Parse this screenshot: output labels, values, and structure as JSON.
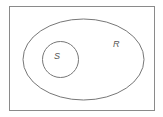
{
  "diagram": {
    "type": "venn",
    "universe": {
      "x": 9.5,
      "y": 6.5,
      "width": 145,
      "height": 104,
      "stroke": "#8a8a8a"
    },
    "sets": [
      {
        "label": "R",
        "shape": "ellipse",
        "cx": 83.5,
        "cy": 59.5,
        "rx": 60.5,
        "ry": 40.5,
        "label_x": 113,
        "label_y": 47,
        "stroke": "#777777"
      },
      {
        "label": "S",
        "shape": "circle",
        "cx": 60.5,
        "cy": 59.5,
        "r": 18,
        "label_x": 54,
        "label_y": 58,
        "stroke": "#777777"
      }
    ],
    "relation": "S is a subset of R"
  }
}
